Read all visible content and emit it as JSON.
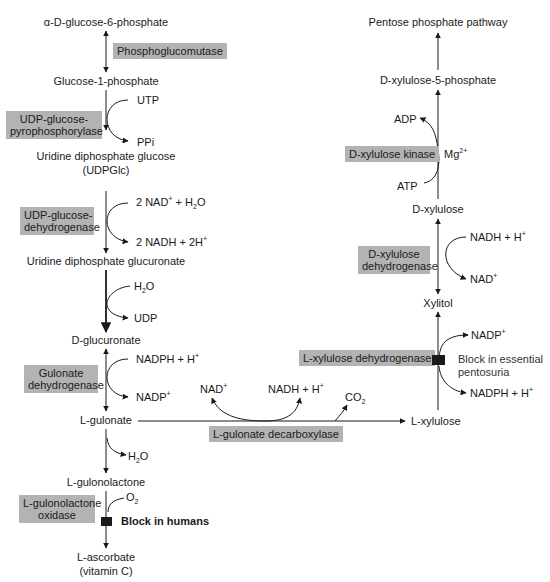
{
  "diagram": {
    "left_pathway": {
      "metabolites": [
        {
          "id": "g6p",
          "label": "α-D-glucose-6-phosphate"
        },
        {
          "id": "g1p",
          "label": "Glucose-1-phosphate"
        },
        {
          "id": "udpglc",
          "label": "Uridine diphosphate glucose",
          "label2": "(UDPGlc)"
        },
        {
          "id": "udpgluc",
          "label": "Uridine diphosphate glucuronate"
        },
        {
          "id": "dgluc",
          "label": "D-glucuronate"
        },
        {
          "id": "lgulonate",
          "label": "L-gulonate"
        },
        {
          "id": "lgulonolactone",
          "label": "L-gulonolactone"
        },
        {
          "id": "lascorbate",
          "label": "L-ascorbate",
          "label2": "(vitamin C)"
        }
      ],
      "enzymes": [
        {
          "label": "Phosphoglucomutase"
        },
        {
          "label": "UDP-glucose-",
          "label2": "pyrophosphorylase"
        },
        {
          "label": "UDP-glucose-",
          "label2": "dehydrogenase"
        },
        {
          "label": "Gulonate",
          "label2": "dehydrogenase"
        },
        {
          "label": "L-gulonolactone",
          "label2": "oxidase"
        }
      ],
      "cofactors": {
        "utp": "UTP",
        "ppi": "PPi",
        "nad_h2o": {
          "pre": "2 NAD",
          "sup": "+",
          "mid": " + H",
          "sub": "2",
          "post": "O"
        },
        "nadh_2h": {
          "pre": "2 NADH + 2H",
          "sup": "+"
        },
        "h2o_in": {
          "pre": "H",
          "sub": "2",
          "post": "O"
        },
        "udp": "UDP",
        "nadph_h": {
          "pre": "NADPH + H",
          "sup": "+"
        },
        "nadp": {
          "pre": "NADP",
          "sup": "+"
        },
        "h2o_out": {
          "pre": "H",
          "sub": "2",
          "post": "O"
        },
        "o2": {
          "pre": "O",
          "sub": "2"
        }
      },
      "block_label": "Block in humans"
    },
    "right_pathway": {
      "metabolites": [
        {
          "id": "ppp",
          "label": "Pentose phosphate pathway"
        },
        {
          "id": "dx5p",
          "label": "D-xylulose-5-phosphate"
        },
        {
          "id": "dxylulose",
          "label": "D-xylulose"
        },
        {
          "id": "xylitol",
          "label": "Xylitol"
        },
        {
          "id": "lxylulose",
          "label": "L-xylulose"
        }
      ],
      "enzymes": [
        {
          "label": "D-xylulose kinase"
        },
        {
          "label": "D-xylulose",
          "label2": "dehydrogenase"
        },
        {
          "label": "L-xylulose dehydrogenase"
        }
      ],
      "cofactors": {
        "adp": "ADP",
        "atp": "ATP",
        "mg": {
          "pre": "Mg",
          "sup": "2+"
        },
        "nadh_h": {
          "pre": "NADH + H",
          "sup": "+"
        },
        "nad": {
          "pre": "NAD",
          "sup": "+"
        },
        "nadp": {
          "pre": "NADP",
          "sup": "+"
        },
        "nadph_h": {
          "pre": "NADPH + H",
          "sup": "+"
        }
      },
      "block_label": "Block in essential",
      "block_label2": "pentosuria"
    },
    "connector": {
      "enzyme": "L-gulonate decarboxylase",
      "nad": {
        "pre": "NAD",
        "sup": "+"
      },
      "nadh_h": {
        "pre": "NADH + H",
        "sup": "+"
      },
      "co2": {
        "pre": "CO",
        "sub": "2"
      }
    },
    "colors": {
      "enzyme_box": "#b3b3b3",
      "line": "#1a1a1a",
      "block": "#1a1a1a",
      "background": "#ffffff"
    }
  }
}
